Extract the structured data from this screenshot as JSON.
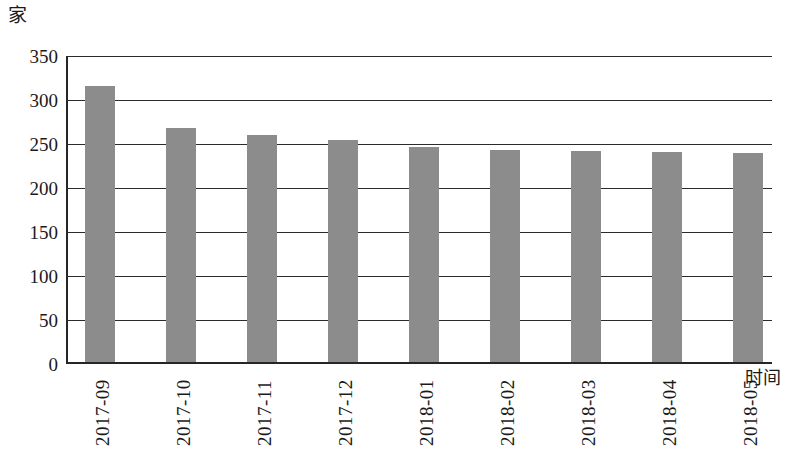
{
  "chart_data": {
    "type": "bar",
    "title": "",
    "subtitle": "",
    "xlabel": "时间",
    "ylabel": "家",
    "ylim": [
      0,
      350
    ],
    "yticks": [
      0,
      50,
      100,
      150,
      200,
      250,
      300,
      350
    ],
    "grid": true,
    "legend": null,
    "legend_position": "none",
    "bar_color": "#8c8c8c",
    "axis_color": "#262626",
    "categories": [
      "2017-09",
      "2017-10",
      "2017-11",
      "2017-12",
      "2018-01",
      "2018-02",
      "2018-03",
      "2018-04",
      "2018-05"
    ],
    "values": [
      314,
      266,
      258,
      252,
      244,
      241,
      240,
      239,
      237
    ],
    "series": [
      {
        "name": "家",
        "values": [
          314,
          266,
          258,
          252,
          244,
          241,
          240,
          239,
          237
        ]
      }
    ],
    "annotations": []
  },
  "axes": {
    "y_unit": "家",
    "x_title": "时间",
    "y_tick_labels": [
      "350",
      "300",
      "250",
      "200",
      "150",
      "100",
      "50",
      "0"
    ],
    "x_tick_labels": [
      "2017-09",
      "2017-10",
      "2017-11",
      "2017-12",
      "2018-01",
      "2018-02",
      "2018-03",
      "2018-04",
      "2018-05"
    ]
  }
}
